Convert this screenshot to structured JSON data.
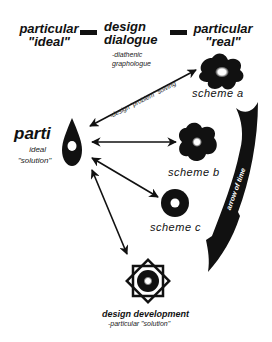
{
  "header": {
    "left": {
      "line1": "particular",
      "line2": "\"ideal\""
    },
    "center": {
      "line1": "design",
      "line2": "dialogue",
      "sub1": "-diathenic",
      "sub2": "graphologue"
    },
    "right": {
      "line1": "particular",
      "line2": "\"real\""
    }
  },
  "parti": {
    "title": "parti",
    "sub1": "ideal",
    "sub2": "\"solution\""
  },
  "arrow_label": "-design \"problem\" solving",
  "schemes": [
    {
      "label": "scheme a"
    },
    {
      "label": "scheme b"
    },
    {
      "label": "scheme c"
    }
  ],
  "time_arrow": {
    "label": "arrow of time"
  },
  "development": {
    "title": "design development",
    "sub": "-particular \"solution\""
  },
  "colors": {
    "ink": "#111111",
    "background": "#ffffff"
  }
}
